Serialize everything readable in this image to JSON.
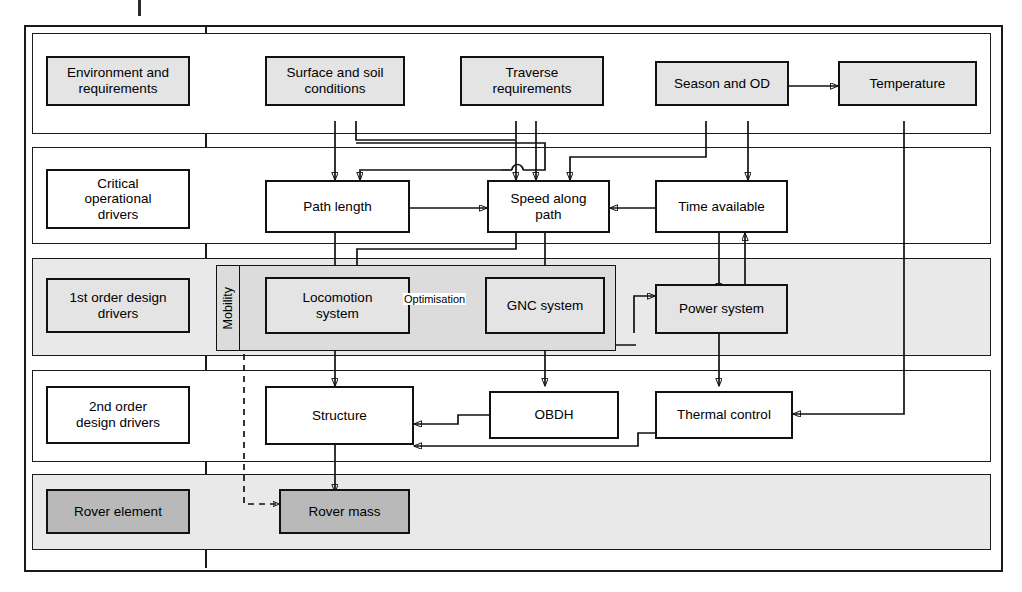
{
  "diagram": {
    "rows": [
      {
        "id": "environment",
        "label": "Environment and\nrequirements",
        "shaded": true
      },
      {
        "id": "critical",
        "label": "Critical\noperational\ndrivers",
        "shaded": false
      },
      {
        "id": "first_order",
        "label": "1st order design\ndrivers",
        "shaded": true
      },
      {
        "id": "second_order",
        "label": "2nd order\ndesign drivers",
        "shaded": false
      },
      {
        "id": "rover_element",
        "label": "Rover element",
        "shaded": true
      }
    ],
    "nodes": [
      {
        "id": "env_label",
        "label": "Environment and requirements",
        "style": "light"
      },
      {
        "id": "surface_soil",
        "label": "Surface and soil conditions",
        "style": "light"
      },
      {
        "id": "traverse_req",
        "label": "Traverse requirements",
        "style": "light"
      },
      {
        "id": "season_od",
        "label": "Season and OD",
        "style": "light"
      },
      {
        "id": "temperature",
        "label": "Temperature",
        "style": "light"
      },
      {
        "id": "crit_label",
        "label": "Critical operational drivers",
        "style": "white"
      },
      {
        "id": "path_length",
        "label": "Path length",
        "style": "white"
      },
      {
        "id": "speed_path",
        "label": "Speed along path",
        "style": "white"
      },
      {
        "id": "time_available",
        "label": "Time available",
        "style": "white"
      },
      {
        "id": "first_label",
        "label": "1st order design drivers",
        "style": "light"
      },
      {
        "id": "locomotion",
        "label": "Locomotion system",
        "style": "light"
      },
      {
        "id": "gnc",
        "label": "GNC system",
        "style": "light"
      },
      {
        "id": "power",
        "label": "Power system",
        "style": "light"
      },
      {
        "id": "second_label",
        "label": "2nd order design drivers",
        "style": "white"
      },
      {
        "id": "structure",
        "label": "Structure",
        "style": "white"
      },
      {
        "id": "obdh",
        "label": "OBDH",
        "style": "white"
      },
      {
        "id": "thermal",
        "label": "Thermal control",
        "style": "white"
      },
      {
        "id": "rover_label",
        "label": "Rover element",
        "style": "dark"
      },
      {
        "id": "rover_mass",
        "label": "Rover mass",
        "style": "dark"
      }
    ],
    "text": {
      "environment_and_requirements_l1": "Environment and",
      "environment_and_requirements_l2": "requirements",
      "surface_and_soil_l1": "Surface and soil",
      "surface_and_soil_l2": "conditions",
      "traverse_l1": "Traverse",
      "traverse_l2": "requirements",
      "season_and_od": "Season and OD",
      "temperature": "Temperature",
      "critical_l1": "Critical",
      "critical_l2": "operational",
      "critical_l3": "drivers",
      "path_length": "Path length",
      "speed_along_l1": "Speed along",
      "speed_along_l2": "path",
      "time_available": "Time available",
      "first_order_l1": "1st order design",
      "first_order_l2": "drivers",
      "mobility": "Mobility",
      "locomotion_l1": "Locomotion",
      "locomotion_l2": "system",
      "optimisation": "Optimisation",
      "gnc_system": "GNC system",
      "power_system": "Power system",
      "second_order_l1": "2nd order",
      "second_order_l2": "design drivers",
      "structure": "Structure",
      "obdh": "OBDH",
      "thermal_control": "Thermal control",
      "rover_element": "Rover element",
      "rover_mass": "Rover mass"
    },
    "colors": {
      "line": "#111111",
      "band_shaded": "#e9e9e9",
      "band_plain": "#ffffff",
      "node_light": "#e4e4e4",
      "node_dark": "#b9b9b9",
      "group_fill": "#dcdcdc"
    }
  }
}
